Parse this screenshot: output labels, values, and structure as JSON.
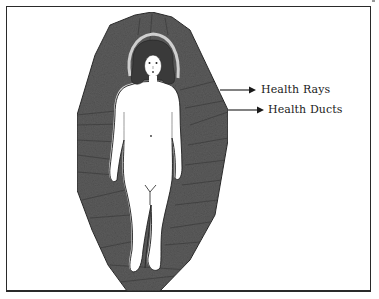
{
  "illustration": {
    "description": "Female figure surrounded by a dark shaded aura with ray lines",
    "colors": {
      "aura": "#5a5a5a",
      "aura_dark": "#3f3f3f",
      "figure": "#ffffff",
      "halo": "#c8c8c8",
      "outline": "#1f1f1f"
    }
  },
  "labels": [
    {
      "text": "Health Rays"
    },
    {
      "text": "Health Ducts"
    }
  ]
}
